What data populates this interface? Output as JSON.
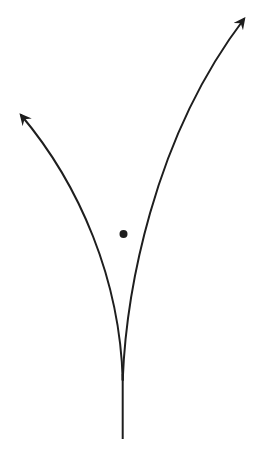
{
  "figure": {
    "canvas": {
      "width": 261,
      "height": 451,
      "background": "#ffffff"
    },
    "style": {
      "stroke": "#1e1e1e",
      "stroke_width": 2
    },
    "curves": {
      "stem": {
        "d": "M 122.7 439 L 122.7 374"
      },
      "left": {
        "d": "M 122.7 380 C 120 280 80 185 21 115"
      },
      "right": {
        "d": "M 122.7 380 C 126 295 152 140 244 19"
      }
    },
    "point": {
      "cx": 123.5,
      "cy": 234,
      "r": 4,
      "fill": "#1e1e1e"
    },
    "arrowhead": {
      "d": "M 0 0 L 10 5 L 0 10 L 3.5 5 z",
      "fill": "#1e1e1e"
    }
  }
}
